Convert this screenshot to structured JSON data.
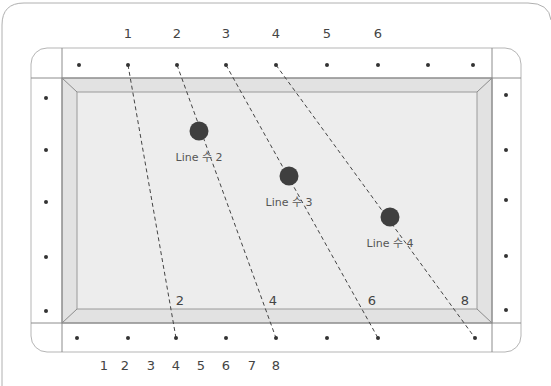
{
  "diagram": {
    "title": "",
    "colors": {
      "frame_stroke": "#9a9a9a",
      "cloth": "#ececec",
      "rail_bevel": "#e0e0e0",
      "diamond_dot": "#333333",
      "ball": "#3f3f3f",
      "guide_line": "#444444",
      "label": "#444444"
    },
    "top_labels": [
      {
        "text": "1",
        "x": 128
      },
      {
        "text": "2",
        "x": 177
      },
      {
        "text": "3",
        "x": 226
      },
      {
        "text": "4",
        "x": 276
      },
      {
        "text": "5",
        "x": 327
      },
      {
        "text": "6",
        "x": 378
      }
    ],
    "bottom_labels": [
      {
        "text": "1",
        "x": 104
      },
      {
        "text": "2",
        "x": 125
      },
      {
        "text": "3",
        "x": 151
      },
      {
        "text": "4",
        "x": 176
      },
      {
        "text": "5",
        "x": 201
      },
      {
        "text": "6",
        "x": 226
      },
      {
        "text": "7",
        "x": 252
      },
      {
        "text": "8",
        "x": 276
      }
    ],
    "inner_bottom_labels": [
      {
        "text": "2",
        "x": 180,
        "y": 305
      },
      {
        "text": "4",
        "x": 273,
        "y": 305
      },
      {
        "text": "6",
        "x": 372,
        "y": 305
      },
      {
        "text": "8",
        "x": 465,
        "y": 305
      }
    ],
    "top_dots_x": [
      79,
      128,
      177,
      226,
      276,
      327,
      378,
      428,
      473
    ],
    "bottom_dots_x": [
      77,
      128,
      176,
      226,
      276,
      327,
      378,
      475
    ],
    "left_dots_y": [
      98,
      150,
      202,
      257,
      311
    ],
    "right_dots_y": [
      95,
      150,
      200,
      256,
      310
    ],
    "balls": [
      {
        "label": "Line 수 2",
        "x": 199,
        "y": 131
      },
      {
        "label": "Line 수 3",
        "x": 289,
        "y": 176
      },
      {
        "label": "Line 수 4",
        "x": 390,
        "y": 217
      }
    ],
    "guide_lines": [
      {
        "from": [
          128,
          65
        ],
        "to": [
          176,
          338
        ]
      },
      {
        "from": [
          177,
          65
        ],
        "to": [
          276,
          338
        ]
      },
      {
        "from": [
          226,
          65
        ],
        "to": [
          378,
          338
        ]
      },
      {
        "from": [
          276,
          65
        ],
        "to": [
          475,
          338
        ]
      }
    ]
  }
}
